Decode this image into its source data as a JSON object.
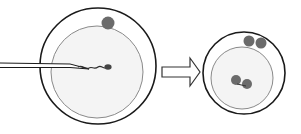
{
  "diagram": {
    "colors": {
      "outline": "#1a1a1a",
      "inner_outline": "#8a8a8a",
      "cytoplasm_fill": "#f4f4f4",
      "body_fill": "#6b6b6b",
      "background": "#ffffff"
    },
    "left_cell": {
      "label": "oocyte-with-injection-pipette",
      "polar_bodies": 1,
      "has_pipette": true,
      "has_sperm": true
    },
    "arrow": {
      "direction": "right"
    },
    "right_cell": {
      "label": "fertilized-oocyte",
      "polar_bodies": 2,
      "pronuclei": 2
    }
  }
}
